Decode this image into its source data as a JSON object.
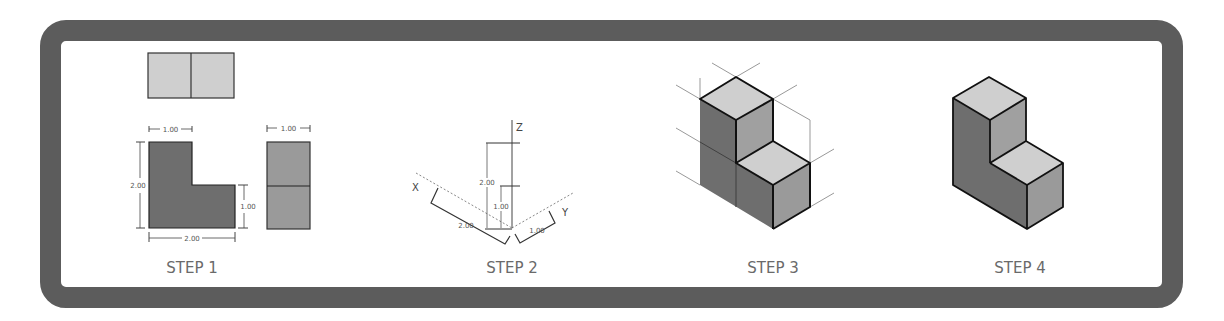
{
  "steps": [
    {
      "label": "STEP 1",
      "description": "Orthographic views: top, front (L-shape), side",
      "dimensions": {
        "front_top_width": "1.00",
        "front_height": "2.00",
        "front_step_height": "1.00",
        "front_width": "2.00",
        "side_width": "1.00"
      }
    },
    {
      "label": "STEP 2",
      "description": "Isometric axes with measurements",
      "axes": {
        "x": "X",
        "y": "Y",
        "z": "Z"
      },
      "dimensions": {
        "z_full": "2.00",
        "z_half": "1.00",
        "x_length": "2.00",
        "y_length": "1.00"
      }
    },
    {
      "label": "STEP 3",
      "description": "Boxed isometric construction with projection lines"
    },
    {
      "label": "STEP 4",
      "description": "Finished isometric L-shaped solid"
    }
  ],
  "colors": {
    "frame": "#5c5c5c",
    "dark_face": "#6e6e6e",
    "mid_face": "#9a9a9a",
    "light_face": "#cfcfcf",
    "label": "#6a6a6a"
  }
}
